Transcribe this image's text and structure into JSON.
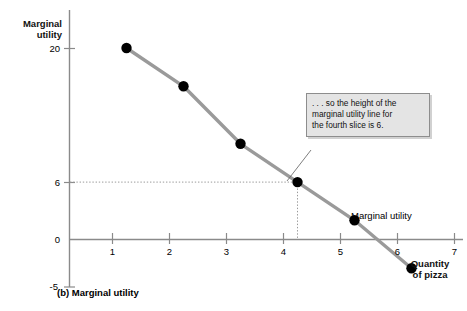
{
  "chart_data": {
    "type": "line",
    "title": "",
    "caption": "(b) Marginal utility",
    "xlabel": "Quantity of pizza",
    "ylabel": "Marginal utility",
    "x": [
      1,
      2,
      3,
      4,
      5,
      6
    ],
    "values": [
      20,
      16,
      10,
      6,
      2,
      -3
    ],
    "series": [
      {
        "name": "Marginal utility",
        "values": [
          20,
          16,
          10,
          6,
          2,
          -3
        ]
      }
    ],
    "xlim": [
      0,
      7
    ],
    "ylim": [
      -5,
      22
    ],
    "xticks": [
      1,
      2,
      3,
      4,
      5,
      6,
      7
    ],
    "xtick_labels": [
      "1",
      "2",
      "3",
      "4",
      "5",
      "6",
      "7"
    ],
    "yticks": [
      -5,
      0,
      6,
      20
    ],
    "ytick_labels": [
      "-5",
      "0",
      "6",
      "20"
    ],
    "grid": false,
    "guide_lines": [
      {
        "type": "horizontal",
        "value": 6,
        "style": "dotted"
      },
      {
        "type": "vertical",
        "value": 4,
        "style": "dotted"
      }
    ],
    "legend_position": "inline-right",
    "annotations": [
      {
        "text": ". . . so the height of the marginal utility line for the fourth slice is 6.",
        "points_to_x": 4,
        "points_to_y": 6
      }
    ],
    "colors": {
      "line": "#9a9a9a",
      "marker": "#000000",
      "axis": "#808080",
      "callout_bg": "#e4e4e4",
      "callout_border": "#8d8d8d",
      "guide": "#9a9a9a"
    }
  },
  "axes": {
    "y_title_line1": "Marginal",
    "y_title_line2": "utility",
    "x_title_line1": "Quantity",
    "x_title_line2": "of pizza"
  },
  "ytick_labels": [
    "20",
    "6",
    "0",
    "-5"
  ],
  "xtick_labels": [
    "1",
    "2",
    "3",
    "4",
    "5",
    "6",
    "7"
  ],
  "series_label": "Marginal utility",
  "callout": {
    "line1": ". . . so the height of the",
    "line2": "marginal utility line for",
    "line3": "the fourth slice is 6."
  },
  "caption": "(b) Marginal utility"
}
